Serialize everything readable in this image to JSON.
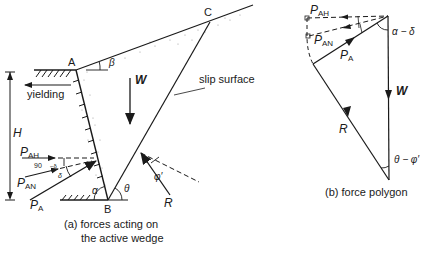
{
  "diagram_a": {
    "points": {
      "A": "A",
      "B": "B",
      "C": "C"
    },
    "labels": {
      "yielding": "yielding",
      "H": "H",
      "W": "W",
      "slip_surface": "slip surface",
      "R": "R",
      "P_AH_main": "P",
      "P_AH_sub": "AH",
      "P_AN_main": "P",
      "P_AN_sub": "AN",
      "P_A_main": "P",
      "P_A_sub": "A",
      "angle_90": "90",
      "angle_minus": "−δ",
      "delta": "δ",
      "alpha": "α",
      "theta": "θ",
      "beta": "β",
      "phi": "φ′"
    },
    "caption_line1": "(a) forces acting on",
    "caption_line2": "the active wedge"
  },
  "diagram_b": {
    "labels": {
      "P_AH_main": "P",
      "P_AH_sub": "AH",
      "P_AN_main": "P",
      "P_AN_sub": "AN",
      "P_A_main": "P",
      "P_A_sub": "A",
      "W": "W",
      "R": "R",
      "alpha_minus_delta": "α − δ",
      "theta_minus_phi": "θ − φ′"
    },
    "caption": "(b) force polygon"
  },
  "colors": {
    "ink": "#1a1a1a",
    "background": "#ffffff",
    "stipple": "#9a9a9a"
  }
}
